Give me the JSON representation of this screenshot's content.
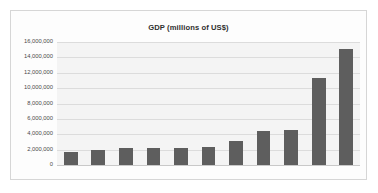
{
  "chart_data": {
    "type": "bar",
    "title": "GDP (millions of US$)",
    "xlabel": "",
    "ylabel": "",
    "categories": [
      "1",
      "2",
      "3",
      "4",
      "5",
      "6",
      "7",
      "8",
      "9",
      "10",
      "11"
    ],
    "values": [
      1750000,
      1950000,
      2200000,
      2250000,
      2250000,
      2350000,
      3100000,
      4400000,
      4500000,
      11300000,
      15100000
    ],
    "ylim": [
      0,
      16000000
    ],
    "y_ticks": [
      0,
      2000000,
      4000000,
      6000000,
      8000000,
      10000000,
      12000000,
      14000000,
      16000000
    ],
    "y_tick_labels": [
      "0",
      "2,000,000",
      "4,000,000",
      "6,000,000",
      "8,000,000",
      "10,000,000",
      "12,000,000",
      "14,000,000",
      "16,000,000"
    ],
    "grid": true,
    "legend": false,
    "legend_position": "none",
    "series_color": "#5e5e5e",
    "plot_background": "#f4f4f4",
    "gridline_color": "#dcdcdc",
    "frame_border_color": "#d6d6d6"
  }
}
